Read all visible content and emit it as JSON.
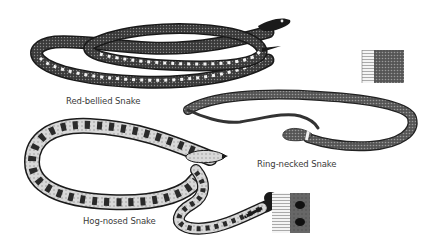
{
  "illustration": {
    "style": "black-and-white engraving",
    "background": "#ffffff",
    "ink": "#1a1a1a",
    "snakes": [
      {
        "id": "red-bellied",
        "label": "Red-bellied Snake",
        "pattern": "dark body with light belly blotches",
        "head_direction": "right"
      },
      {
        "id": "ring-necked",
        "label": "Ring-necked Snake",
        "pattern": "uniform dark gray, light neck ring",
        "head_direction": "left"
      },
      {
        "id": "hog-nosed",
        "label": "Hog-nosed Snake",
        "pattern": "light body with dark irregular blotches",
        "head_direction": "right"
      }
    ],
    "scale_swatches": [
      {
        "id": "swatch-ring-necked",
        "description": "belly scutes and dorsal scale texture"
      },
      {
        "id": "swatch-hog-nosed",
        "description": "belly scutes and blotched dorsal texture"
      }
    ]
  }
}
